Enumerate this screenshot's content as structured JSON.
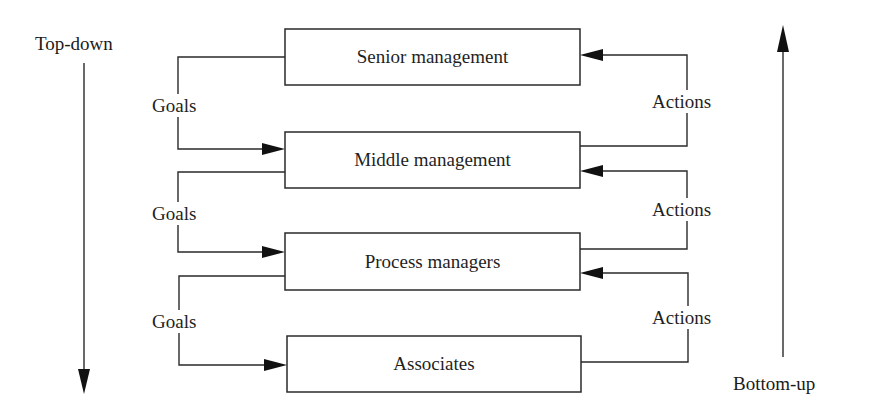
{
  "diagram": {
    "title": "",
    "direction_labels": {
      "top_down": "Top-down",
      "bottom_up": "Bottom-up"
    },
    "levels": [
      {
        "id": "senior",
        "label": "Senior management"
      },
      {
        "id": "middle",
        "label": "Middle management"
      },
      {
        "id": "process",
        "label": "Process managers"
      },
      {
        "id": "associates",
        "label": "Associates"
      }
    ],
    "flows": {
      "down_label": "Goals",
      "up_label": "Actions",
      "goals": [
        {
          "from": "Senior management",
          "to": "Middle management",
          "label": "Goals"
        },
        {
          "from": "Middle management",
          "to": "Process managers",
          "label": "Goals"
        },
        {
          "from": "Process managers",
          "to": "Associates",
          "label": "Goals"
        }
      ],
      "actions": [
        {
          "from": "Middle management",
          "to": "Senior management",
          "label": "Actions"
        },
        {
          "from": "Process managers",
          "to": "Middle management",
          "label": "Actions"
        },
        {
          "from": "Associates",
          "to": "Process managers",
          "label": "Actions"
        }
      ]
    },
    "colors": {
      "line": "#2a2a2a",
      "arrowhead": "#111111",
      "box_fill": "#ffffff",
      "text": "#1f1f1f"
    }
  }
}
